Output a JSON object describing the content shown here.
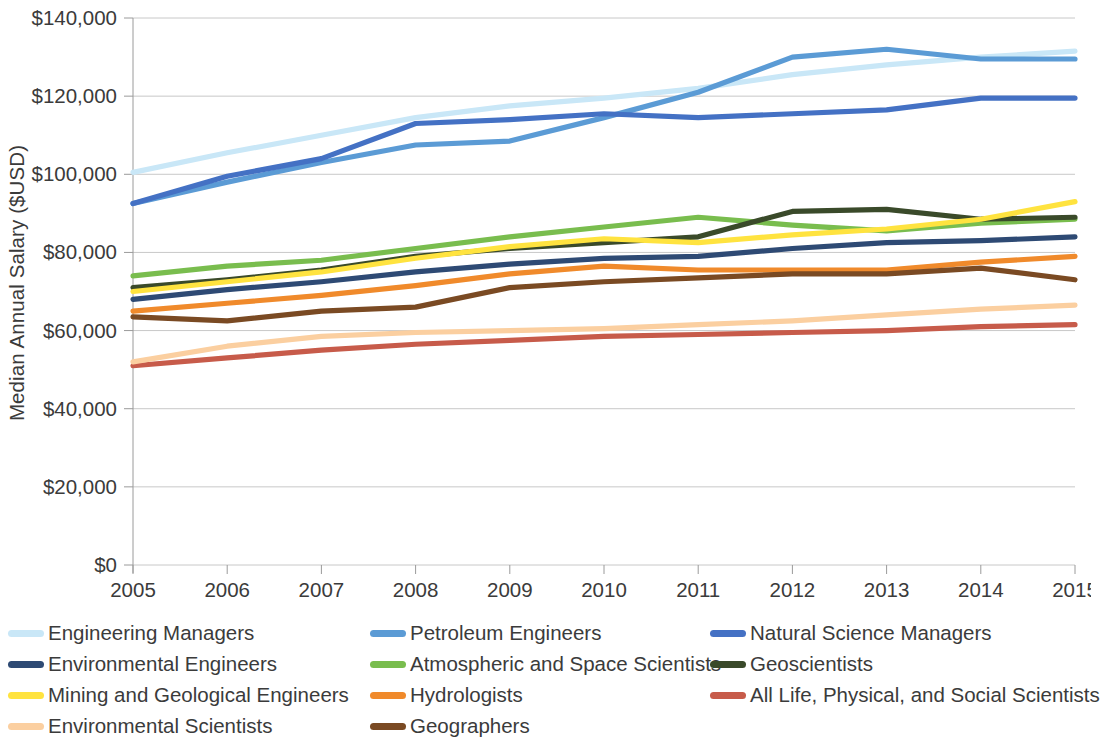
{
  "chart": {
    "type": "line",
    "y_axis_title": "Median Annual Salary ($USD)",
    "x_axis_title": "",
    "title": ""
  },
  "axis": {
    "y_ticks": [
      "$0",
      "$20,000",
      "$40,000",
      "$60,000",
      "$80,000",
      "$100,000",
      "$120,000",
      "$140,000"
    ],
    "x_ticks": [
      "2005",
      "2006",
      "2007",
      "2008",
      "2009",
      "2010",
      "2011",
      "2012",
      "2013",
      "2014",
      "2015"
    ]
  },
  "legend": {
    "items": [
      {
        "label": "Engineering Managers",
        "color": "#c9e7f7"
      },
      {
        "label": "Petroleum Engineers",
        "color": "#5b9bd5"
      },
      {
        "label": "Natural Science Managers",
        "color": "#4471c4"
      },
      {
        "label": "Environmental Engineers",
        "color": "#2e4a74"
      },
      {
        "label": "Atmospheric and Space Scientists",
        "color": "#79bd4e"
      },
      {
        "label": "Geoscientists",
        "color": "#3a4a2a"
      },
      {
        "label": "Mining and Geological Engineers",
        "color": "#ffe33f"
      },
      {
        "label": "Hydrologists",
        "color": "#f08a2b"
      },
      {
        "label": "All Life, Physical, and Social Scientists",
        "color": "#c75b4a"
      },
      {
        "label": "Environmental Scientists",
        "color": "#fbcfa0"
      },
      {
        "label": "Geographers",
        "color": "#7a4a23"
      }
    ]
  },
  "chart_data": {
    "type": "line",
    "title": "",
    "xlabel": "",
    "ylabel": "Median Annual Salary ($USD)",
    "categories": [
      2005,
      2006,
      2007,
      2008,
      2009,
      2010,
      2011,
      2012,
      2013,
      2014,
      2015
    ],
    "ylim": [
      0,
      140000
    ],
    "xlim": [
      2005,
      2015
    ],
    "grid": true,
    "legend_position": "bottom",
    "series": [
      {
        "name": "Engineering Managers",
        "color": "#c9e7f7",
        "values": [
          100500,
          105500,
          110000,
          114500,
          117500,
          119500,
          122000,
          125500,
          128000,
          130000,
          131500
        ]
      },
      {
        "name": "Petroleum Engineers",
        "color": "#5b9bd5",
        "values": [
          92500,
          98000,
          103000,
          107500,
          108500,
          114500,
          121000,
          130000,
          132000,
          129500,
          129500
        ]
      },
      {
        "name": "Natural Science Managers",
        "color": "#4471c4",
        "values": [
          92500,
          99500,
          104000,
          113000,
          114000,
          115500,
          114500,
          115500,
          116500,
          119500,
          119500
        ]
      },
      {
        "name": "Environmental Engineers",
        "color": "#2e4a74",
        "values": [
          68000,
          70500,
          72500,
          75000,
          77000,
          78500,
          79000,
          81000,
          82500,
          83000,
          84000
        ]
      },
      {
        "name": "Atmospheric and Space Scientists",
        "color": "#79bd4e",
        "values": [
          74000,
          76500,
          78000,
          81000,
          84000,
          86500,
          89000,
          87000,
          85500,
          87500,
          88500
        ]
      },
      {
        "name": "Geoscientists",
        "color": "#3a4a2a",
        "values": [
          71000,
          73000,
          75500,
          79000,
          81000,
          82500,
          84000,
          90500,
          91000,
          88500,
          89000
        ]
      },
      {
        "name": "Mining and Geological Engineers",
        "color": "#ffe33f",
        "values": [
          70000,
          72500,
          75000,
          78500,
          81500,
          83500,
          82500,
          84500,
          86000,
          88500,
          93000
        ]
      },
      {
        "name": "Hydrologists",
        "color": "#f08a2b",
        "values": [
          65000,
          67000,
          69000,
          71500,
          74500,
          76500,
          75500,
          75500,
          75500,
          77500,
          79000
        ]
      },
      {
        "name": "All Life, Physical, and Social Scientists",
        "color": "#c75b4a",
        "values": [
          51000,
          53000,
          55000,
          56500,
          57500,
          58500,
          59000,
          59500,
          60000,
          61000,
          61500
        ]
      },
      {
        "name": "Environmental Scientists",
        "color": "#fbcfa0",
        "values": [
          52000,
          56000,
          58500,
          59500,
          60000,
          60500,
          61500,
          62500,
          64000,
          65500,
          66500
        ]
      },
      {
        "name": "Geographers",
        "color": "#7a4a23",
        "values": [
          63500,
          62500,
          65000,
          66000,
          71000,
          72500,
          73500,
          74500,
          74500,
          76000,
          73000
        ]
      }
    ]
  }
}
